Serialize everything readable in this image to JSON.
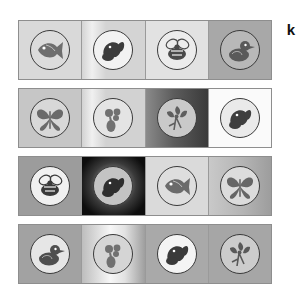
{
  "panel": {
    "label": "k",
    "figure_type": "image-grid",
    "rows": 4,
    "columns": 4
  },
  "palette": {
    "stamp_outline": "#3a3a3a",
    "row_border": "#8e8e8e",
    "tile_divider": "#9a9a9a",
    "label_color": "#101010",
    "page_background": "#ffffff"
  },
  "grid": {
    "rows": [
      {
        "row_label": "row-1",
        "tiles": [
          {
            "tile_label": "tile-1-1",
            "motif": "fish",
            "background": "#d9d9d9",
            "background_style": "flat",
            "seal_fill": "#dcdcdc",
            "ink": "#6e6e6e"
          },
          {
            "tile_label": "tile-1-2",
            "motif": "squirrel",
            "background": "#d4d4d4",
            "background_style": "vertical-light-band",
            "seal_fill": "#f2f2f2",
            "ink": "#3c3c3c"
          },
          {
            "tile_label": "tile-1-3",
            "motif": "bee",
            "background": "#e2e2e2",
            "background_style": "flat",
            "seal_fill": "#ececec",
            "ink": "#4a4a4a"
          },
          {
            "tile_label": "tile-1-4",
            "motif": "duck",
            "background": "#a8a8a8",
            "background_style": "flat",
            "seal_fill": "#b8b8b8",
            "ink": "#5a5a5a"
          }
        ]
      },
      {
        "row_label": "row-2",
        "tiles": [
          {
            "tile_label": "tile-2-1",
            "motif": "butterfly",
            "background": "#c6c6c6",
            "background_style": "flat",
            "seal_fill": "#d8d8d8",
            "ink": "#6a6a6a"
          },
          {
            "tile_label": "tile-2-2",
            "motif": "rattle",
            "background": "#d2d2d2",
            "background_style": "vertical-light-band",
            "seal_fill": "#e4e4e4",
            "ink": "#717171"
          },
          {
            "tile_label": "tile-2-3",
            "motif": "flower",
            "background": "#5c5c5c",
            "background_style": "horizontal-dark-gradient",
            "seal_fill": "#c9c9c9",
            "ink": "#5e5e5e"
          },
          {
            "tile_label": "tile-2-4",
            "motif": "squirrel",
            "background": "#fafafa",
            "background_style": "flat",
            "seal_fill": "#eaeaea",
            "ink": "#3f3f3f"
          }
        ]
      },
      {
        "row_label": "row-3",
        "tiles": [
          {
            "tile_label": "tile-3-1",
            "motif": "bee",
            "background": "#9c9c9c",
            "background_style": "flat",
            "seal_fill": "#f0f0f0",
            "ink": "#3a3a3a"
          },
          {
            "tile_label": "tile-3-2",
            "motif": "squirrel",
            "background": "#0d0d0d",
            "background_style": "radial-vignette",
            "seal_fill": "#c3c3c3",
            "ink": "#2e2e2e"
          },
          {
            "tile_label": "tile-3-3",
            "motif": "fish",
            "background": "#dadada",
            "background_style": "flat",
            "seal_fill": "#dedede",
            "ink": "#6b6b6b"
          },
          {
            "tile_label": "tile-3-4",
            "motif": "butterfly",
            "background": "#b4b4b4",
            "background_style": "horizontal-light-gradient",
            "seal_fill": "#dcdcdc",
            "ink": "#666666"
          }
        ]
      },
      {
        "row_label": "row-4",
        "tiles": [
          {
            "tile_label": "tile-4-1",
            "motif": "duck",
            "background": "#a2a2a2",
            "background_style": "flat",
            "seal_fill": "#e6e6e6",
            "ink": "#4e4e4e"
          },
          {
            "tile_label": "tile-4-2",
            "motif": "rattle",
            "background": "#bdbdbd",
            "background_style": "horizontal-bright-gradient",
            "seal_fill": "#d5d5d5",
            "ink": "#707070"
          },
          {
            "tile_label": "tile-4-3",
            "motif": "squirrel",
            "background": "#a9a9a9",
            "background_style": "flat",
            "seal_fill": "#f4f4f4",
            "ink": "#3a3a3a"
          },
          {
            "tile_label": "tile-4-4",
            "motif": "flower",
            "background": "#a6a6a6",
            "background_style": "flat",
            "seal_fill": "#cccccc",
            "ink": "#595959"
          }
        ]
      }
    ]
  }
}
